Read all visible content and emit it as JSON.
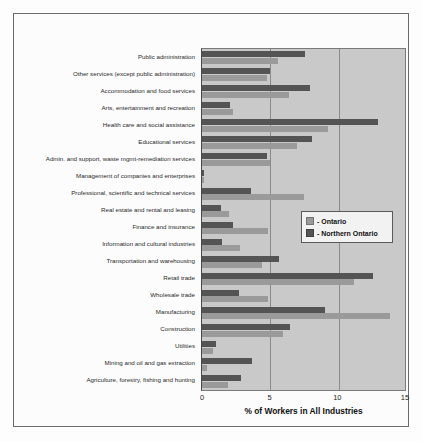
{
  "chart_data": {
    "type": "bar",
    "orientation": "horizontal",
    "title": "",
    "xlabel": "% of Workers in All Industries",
    "ylabel": "",
    "xlim": [
      0,
      15
    ],
    "xticks": [
      0,
      5,
      10,
      15
    ],
    "grid": true,
    "legend_position": "middle-right",
    "categories": [
      "Public administration",
      "Other services (except public administration)",
      "Accommodation and food services",
      "Arts, entertainment and recreation",
      "Health care and social assistance",
      "Educational services",
      "Admin. and support, waste mgmt-remediation services",
      "Management of companies and enterprises",
      "Professional, scientific and technical services",
      "Real estate and rental and leasing",
      "Finance and insurance",
      "Information and cultural industries",
      "Transportation and warehousing",
      "Retail trade",
      "Wholesale trade",
      "Manufacturing",
      "Construction",
      "Utilities",
      "Mining and oil and gas extraction",
      "Agriculture, forestry, fishing and hunting"
    ],
    "series": [
      {
        "name": "- Northern Ontario",
        "color": "#545454",
        "values": [
          7.6,
          5.0,
          8.0,
          2.1,
          13.0,
          8.1,
          4.8,
          0.15,
          3.6,
          1.4,
          2.3,
          1.5,
          5.7,
          12.6,
          2.7,
          9.1,
          6.5,
          1.0,
          3.7,
          2.9
        ]
      },
      {
        "name": "- Ontario",
        "color": "#9a9a9a",
        "values": [
          5.6,
          4.8,
          6.4,
          2.3,
          9.3,
          7.0,
          5.0,
          0.15,
          7.5,
          2.0,
          4.9,
          2.8,
          4.4,
          11.2,
          4.9,
          13.9,
          6.0,
          0.8,
          0.4,
          1.9
        ]
      }
    ]
  },
  "legend": {
    "items": [
      {
        "label": "- Ontario",
        "color": "#9a9a9a"
      },
      {
        "label": "- Northern Ontario",
        "color": "#545454"
      }
    ]
  }
}
